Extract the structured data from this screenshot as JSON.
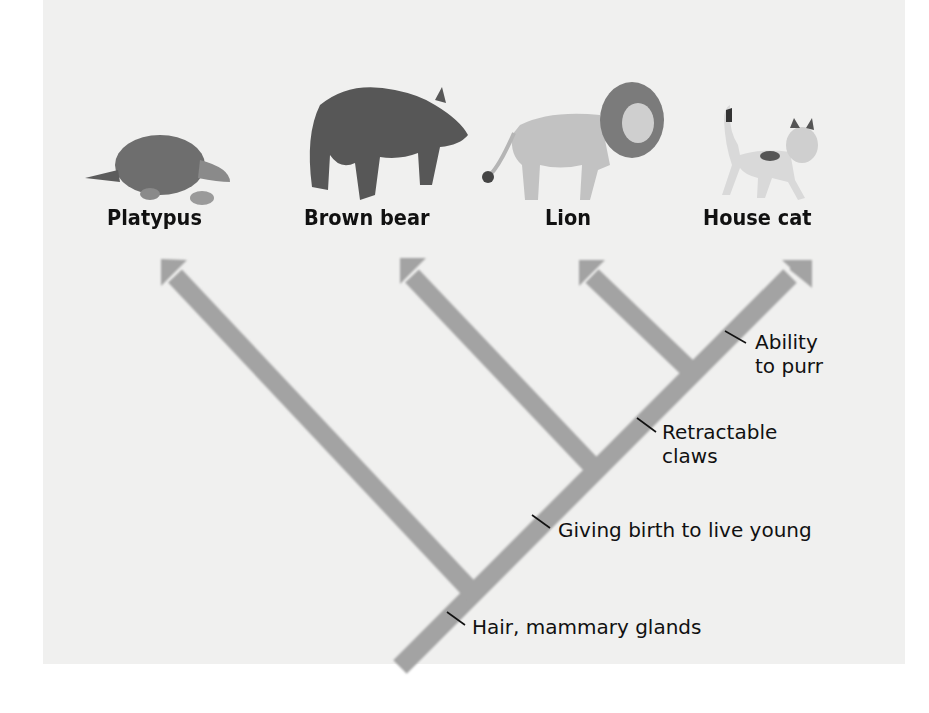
{
  "diagram": {
    "type": "cladogram",
    "taxa": [
      {
        "name": "Platypus"
      },
      {
        "name": "Brown bear"
      },
      {
        "name": "Lion"
      },
      {
        "name": "House cat"
      }
    ],
    "traits": [
      {
        "line1": "Hair, mammary glands"
      },
      {
        "line1": "Giving birth to live young"
      },
      {
        "line1": "Retractable",
        "line2": "claws"
      },
      {
        "line1": "Ability",
        "line2": "to purr"
      }
    ],
    "colors": {
      "branch": "#a3a3a3",
      "background": "#f0f0ef",
      "text": "#111111"
    }
  }
}
